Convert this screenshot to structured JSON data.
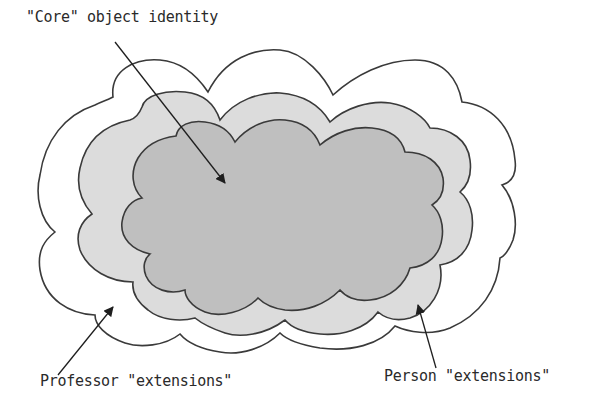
{
  "diagram": {
    "labels": {
      "core": "\"Core\" object identity",
      "professor": "Professor \"extensions\"",
      "person": "Person \"extensions\""
    },
    "regions": [
      {
        "name": "professor-extensions",
        "fill": "#ffffff",
        "stroke": "#3a3a3a"
      },
      {
        "name": "person-extensions",
        "fill": "#dcdcdc",
        "stroke": "#3a3a3a"
      },
      {
        "name": "core-object-identity",
        "fill": "#bfbfbf",
        "stroke": "#3a3a3a"
      }
    ],
    "colors": {
      "outline": "#3a3a3a",
      "outer_fill": "#ffffff",
      "middle_fill": "#dcdcdc",
      "inner_fill": "#bfbfbf",
      "text": "#2a2a2a"
    }
  }
}
